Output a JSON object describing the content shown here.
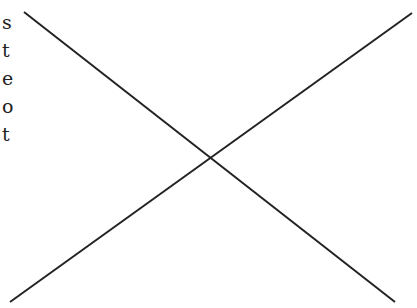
{
  "letters": [
    "s",
    "t",
    "e",
    "o",
    "t"
  ],
  "lines": [
    {
      "name": "descending-line",
      "x1": 24,
      "y1": 12,
      "x2": 395,
      "y2": 302
    },
    {
      "name": "ascending-line",
      "x1": 10,
      "y1": 302,
      "x2": 412,
      "y2": 13
    }
  ],
  "stroke_color": "#222222"
}
